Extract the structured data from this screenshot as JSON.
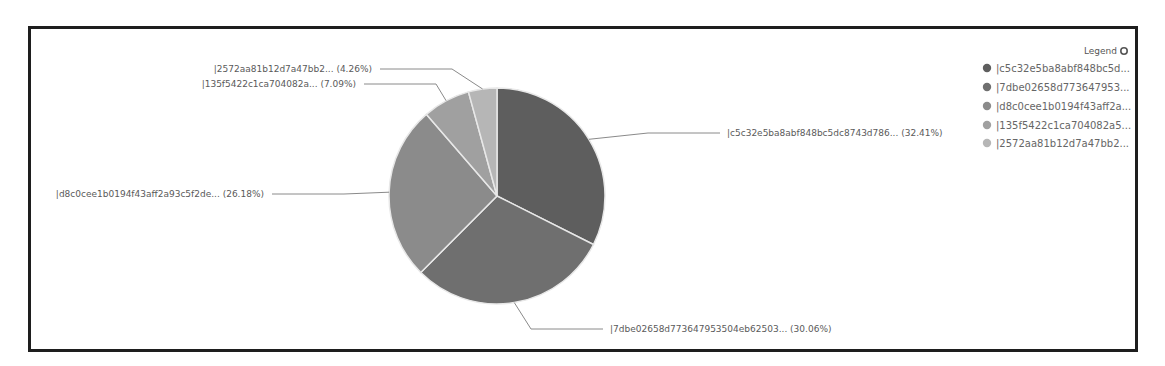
{
  "chart_data": {
    "type": "pie",
    "title": "",
    "legend": {
      "title": "Legend",
      "position": "right",
      "entries": [
        "|c5c32e5ba8abf848bc5d...",
        "|7dbe02658d773647953...",
        "|d8c0cee1b0194f43aff2a...",
        "|135f5422c1ca704082a5...",
        "|2572aa81b12d7a47bb2..."
      ]
    },
    "slices": [
      {
        "label": "|c5c32e5ba8abf848bc5dc8743d786... (32.41%)",
        "name": "c5c32e5ba8abf848bc5dc8743d786...",
        "value": 32.41,
        "color": "#5e5e5e"
      },
      {
        "label": "|7dbe02658d773647953504eb62503... (30.06%)",
        "name": "7dbe02658d773647953504eb62503...",
        "value": 30.06,
        "color": "#6f6f6f"
      },
      {
        "label": "|d8c0cee1b0194f43aff2a93c5f2de... (26.18%)",
        "name": "d8c0cee1b0194f43aff2a93c5f2de...",
        "value": 26.18,
        "color": "#8b8b8b"
      },
      {
        "label": "|135f5422c1ca704082a... (7.09%)",
        "name": "135f5422c1ca704082a...",
        "value": 7.09,
        "color": "#a0a0a0"
      },
      {
        "label": "|2572aa81b12d7a47bb2... (4.26%)",
        "name": "2572aa81b12d7a47bb2...",
        "value": 4.26,
        "color": "#b6b6b6"
      }
    ],
    "start_angle_deg": 0,
    "direction": "clockwise"
  },
  "legend_icon": "settings-circle-icon"
}
